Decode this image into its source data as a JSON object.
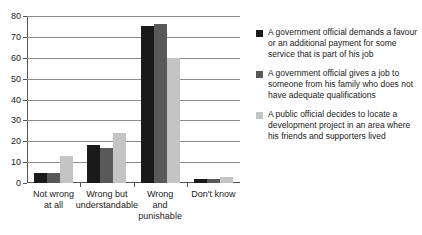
{
  "chart_data": {
    "type": "bar",
    "title": "",
    "subtitle": "",
    "xlabel": "",
    "ylabel": "",
    "ylim": [
      0,
      80
    ],
    "yticks": [
      0,
      10,
      20,
      30,
      40,
      50,
      60,
      70,
      80
    ],
    "ytick_labels": [
      "0",
      "10",
      "20",
      "30",
      "40",
      "50",
      "60",
      "70",
      "80"
    ],
    "grid": "horizontal",
    "legend_position": "right",
    "categories": [
      "Not wrong\nat all",
      "Wrong but\nunderstandable",
      "Wrong\nand\npunishable",
      "Don't know"
    ],
    "category_lines": [
      [
        "Not wrong",
        "at all"
      ],
      [
        "Wrong but",
        "understandable"
      ],
      [
        "Wrong",
        "and",
        "punishable"
      ],
      [
        "Don't know"
      ]
    ],
    "series": [
      {
        "name": "A government official demands a favour or an additional payment for some service that is part of his job",
        "color": "#1a1a1a",
        "values": [
          5,
          18,
          75,
          2
        ]
      },
      {
        "name": "A government official gives a job to someone from his family who does not have adequate qualifications",
        "color": "#595959",
        "values": [
          5,
          17,
          76,
          2
        ]
      },
      {
        "name": "A public official decides to locate a development project in an area where his friends and supporters lived",
        "color": "#c4c4c4",
        "values": [
          13,
          24,
          60,
          3
        ]
      }
    ]
  },
  "legend": {
    "entries": [
      {
        "color": "#1a1a1a",
        "label": "A government official demands a favour or an additional payment for some service that is part of his job"
      },
      {
        "color": "#595959",
        "label": "A government official gives a job to someone from his family who does not have adequate qualifications"
      },
      {
        "color": "#c4c4c4",
        "label": "A public official decides to locate a development project in an area where his friends and supporters lived"
      }
    ]
  },
  "colors": {
    "series_1": "#1a1a1a",
    "series_2": "#595959",
    "series_3": "#c4c4c4",
    "axis": "#555555",
    "gridline": "#8c8c8c",
    "background": "#ffffff",
    "text": "#1a1a1a"
  }
}
